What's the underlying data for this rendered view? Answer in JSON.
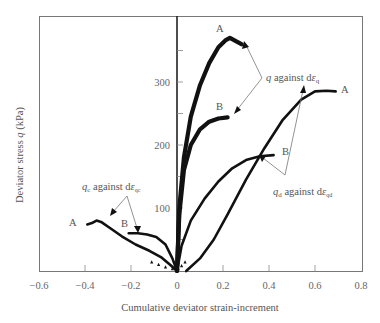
{
  "chart_data": {
    "type": "line",
    "title": "",
    "xlabel": "Cumulative deviator strain-increment",
    "ylabel": "Deviator stress q (kPa)",
    "xlim": [
      -0.6,
      0.8
    ],
    "ylim": [
      0,
      410
    ],
    "x_ticks": [
      -0.6,
      -0.4,
      -0.2,
      0,
      0.2,
      0.4,
      0.6,
      0.8
    ],
    "x_tick_labels": [
      "−0.6",
      "−0.4",
      "−0.2",
      "0",
      "0.2",
      "0.4",
      "0.6",
      "0.8"
    ],
    "y_ticks": [
      100,
      200,
      300
    ],
    "y_tick_labels": [
      "100",
      "200",
      "300"
    ],
    "y_minor_ticks": [
      50,
      150,
      250,
      350
    ],
    "grid": false,
    "legend": null,
    "series": [
      {
        "name": "q against dεq (A)",
        "style": "thick-line",
        "x": [
          0,
          0.01,
          0.03,
          0.06,
          0.1,
          0.14,
          0.18,
          0.21,
          0.23,
          0.24,
          0.26,
          0.28
        ],
        "y": [
          0,
          100,
          180,
          245,
          295,
          330,
          355,
          366,
          370,
          368,
          364,
          360
        ]
      },
      {
        "name": "q against dεq (B)",
        "style": "thick-line",
        "x": [
          0,
          0.01,
          0.03,
          0.06,
          0.1,
          0.14,
          0.18,
          0.22
        ],
        "y": [
          0,
          90,
          160,
          200,
          225,
          237,
          242,
          244
        ]
      },
      {
        "name": "qd against dεqd (A)",
        "style": "line",
        "x": [
          0.04,
          0.1,
          0.16,
          0.22,
          0.3,
          0.38,
          0.46,
          0.54,
          0.6,
          0.65,
          0.69
        ],
        "y": [
          0,
          20,
          50,
          90,
          145,
          195,
          240,
          272,
          285,
          286,
          285
        ]
      },
      {
        "name": "qd against dεqd (B)",
        "style": "line",
        "x": [
          0,
          0.02,
          0.06,
          0.12,
          0.18,
          0.24,
          0.3,
          0.36,
          0.42
        ],
        "y": [
          0,
          40,
          80,
          115,
          142,
          163,
          176,
          182,
          184
        ]
      },
      {
        "name": "qc against dεqc (A)",
        "style": "line",
        "x": [
          0,
          -0.03,
          -0.07,
          -0.12,
          -0.18,
          -0.24,
          -0.29,
          -0.33,
          -0.35,
          -0.37,
          -0.39
        ],
        "y": [
          0,
          10,
          22,
          32,
          42,
          55,
          68,
          78,
          80,
          76,
          74
        ]
      },
      {
        "name": "qc against dεqc (B)",
        "style": "line",
        "x": [
          0,
          -0.02,
          -0.05,
          -0.09,
          -0.13,
          -0.17,
          -0.21
        ],
        "y": [
          0,
          20,
          42,
          54,
          58,
          60,
          60
        ]
      }
    ],
    "annotations": [
      {
        "text": "A",
        "x": 0.21,
        "y": 378
      },
      {
        "text": "B",
        "x": 0.21,
        "y": 258
      },
      {
        "text": "A",
        "x": 0.73,
        "y": 288
      },
      {
        "text": "B",
        "x": 0.47,
        "y": 188
      },
      {
        "text": "A",
        "x": -0.44,
        "y": 76
      },
      {
        "text": "B",
        "x": -0.24,
        "y": 70
      },
      {
        "text": "q against dεq",
        "x": 0.36,
        "y": 338
      },
      {
        "text": "qd against dεqd",
        "x": 0.55,
        "y": 130
      },
      {
        "text": "qc against dεqc",
        "x": -0.23,
        "y": 130
      }
    ]
  },
  "labels": {
    "ylabel_pre": "Deviator stress ",
    "ylabel_var": "q",
    "ylabel_post": " (kPa)",
    "xlabel": "Cumulative deviator strain-increment",
    "ann_q_var": "q",
    "ann_q_text": " against d",
    "ann_q_eps": "ε",
    "ann_q_sub": "q",
    "ann_qd_var": "q",
    "ann_qd_sub1": "d",
    "ann_qd_text": " against d",
    "ann_qd_eps": "ε",
    "ann_qd_sub2": "qd",
    "ann_qc_var": "q",
    "ann_qc_sub1": "c",
    "ann_qc_text": " against d",
    "ann_qc_eps": "ε",
    "ann_qc_sub2": "qc",
    "point_A": "A",
    "point_B": "B"
  }
}
